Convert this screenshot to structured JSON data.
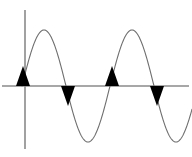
{
  "figure": {
    "background_color": "#ffffff",
    "width": 192,
    "height": 157
  },
  "axes": {
    "color": "#8a8a8a",
    "stroke_width": 1.6,
    "x_axis": {
      "name": "horizontal-axis",
      "y": 86,
      "x_start": 2,
      "x_end": 189,
      "label": ""
    },
    "y_axis": {
      "name": "vertical-axis",
      "x": 25,
      "y_start": 10,
      "y_end": 149,
      "label": ""
    }
  },
  "chart_data": {
    "type": "line",
    "title": "",
    "xlabel": "",
    "ylabel": "",
    "grid": false,
    "legend": null,
    "curve_color": "#6e6e6e",
    "curve_stroke_width": 1.1,
    "amplitude_px": 56,
    "wavelength_px": 88,
    "baseline_y_px": 86,
    "phase_start_x_px": 22,
    "x_domain_px": [
      22,
      192
    ],
    "cycles_shown": 1.9,
    "peaks": [
      {
        "label": "peak-1",
        "x": 44,
        "y": 30
      },
      {
        "label": "peak-2",
        "x": 132,
        "y": 30
      }
    ],
    "troughs": [
      {
        "label": "trough-1",
        "x": 88,
        "y": 142
      }
    ],
    "zero_crossings": [
      {
        "label": "crossing-1",
        "x": 22,
        "y": 86,
        "direction": "rising"
      },
      {
        "label": "crossing-2",
        "x": 66,
        "y": 86,
        "direction": "falling"
      },
      {
        "label": "crossing-3",
        "x": 110,
        "y": 86,
        "direction": "rising"
      },
      {
        "label": "crossing-4",
        "x": 154,
        "y": 86,
        "direction": "falling"
      }
    ]
  },
  "arrowheads": {
    "color": "#000000",
    "half_width_px": 7,
    "length_px": 20,
    "items": [
      {
        "name": "arrowhead-up-1",
        "x": 23,
        "direction": "up"
      },
      {
        "name": "arrowhead-down-1",
        "x": 68,
        "direction": "down"
      },
      {
        "name": "arrowhead-up-2",
        "x": 112,
        "direction": "up"
      },
      {
        "name": "arrowhead-down-2",
        "x": 157,
        "direction": "down"
      }
    ]
  }
}
